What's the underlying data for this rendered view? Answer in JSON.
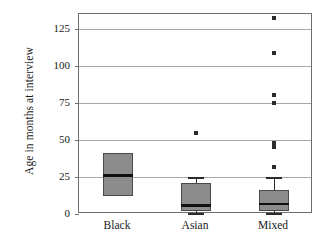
{
  "chart_data": {
    "type": "box",
    "title": "",
    "xlabel": "",
    "ylabel": "Age in months at interview",
    "categories": [
      "Black",
      "Asian",
      "Mixed"
    ],
    "ylim": [
      0,
      135
    ],
    "yticks": [
      0,
      25,
      50,
      75,
      100,
      125
    ],
    "ytick_labels": [
      "0",
      "25",
      "50",
      "75",
      "100",
      "125"
    ],
    "grid": "horizontal",
    "legend": "none",
    "box_fill_color": "#8c8c8c",
    "box_edge_color": "#4a4a4a",
    "median_color": "#101010",
    "gridline_color": "#a8a8a8",
    "frame_color": "#6d6d6d",
    "boxes": [
      {
        "category": "Black",
        "q1": 12,
        "median": 26,
        "q3": 41,
        "whisker_low": 12,
        "whisker_high": 41,
        "outliers": []
      },
      {
        "category": "Asian",
        "q1": 2,
        "median": 6,
        "q3": 21,
        "whisker_low": 1,
        "whisker_high": 25,
        "outliers": [
          55
        ]
      },
      {
        "category": "Mixed",
        "q1": 2,
        "median": 7,
        "q3": 16,
        "whisker_low": 1,
        "whisker_high": 25,
        "outliers": [
          132,
          109,
          80,
          75,
          48,
          45,
          32
        ]
      }
    ]
  }
}
